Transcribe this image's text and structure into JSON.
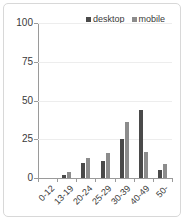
{
  "chart_data": {
    "type": "bar",
    "title": "",
    "subtitle": "",
    "xlabel": "",
    "ylabel": "",
    "categories": [
      "0-12",
      "13-19",
      "20-24",
      "25-29",
      "30-39",
      "40-49",
      "50-"
    ],
    "series": [
      {
        "name": "desktop",
        "color": "#4a4a4a",
        "values": [
          0,
          2,
          10,
          11,
          25,
          44,
          5
        ]
      },
      {
        "name": "mobile",
        "color": "#8c8c8c",
        "values": [
          0,
          4,
          13,
          16,
          36,
          17,
          9
        ]
      }
    ],
    "ylim": [
      0,
      100
    ],
    "yticks": [
      0,
      25,
      50,
      75,
      100
    ],
    "ytick_labels": [
      "0",
      "25",
      "50",
      "75",
      "100"
    ],
    "grid": true,
    "grid_axis": "y",
    "legend_position": "top-right",
    "xtick_label_rotation": -45
  },
  "legend": {
    "entries": [
      {
        "label": "desktop",
        "marker": "square-marker",
        "color": "#4a4a4a"
      },
      {
        "label": "mobile",
        "marker": "square-marker",
        "color": "#8c8c8c"
      }
    ]
  },
  "axes": {
    "y_tick_labels": [
      "100",
      "75",
      "50",
      "25",
      "0"
    ],
    "x_tick_labels": [
      "0-12",
      "13-19",
      "20-24",
      "25-29",
      "30-39",
      "40-49",
      "50-"
    ]
  },
  "colors": {
    "desktop": "#4a4a4a",
    "mobile": "#8c8c8c",
    "grid": "#ededed",
    "axis": "#9a9a9a",
    "border": "#d8d8d8",
    "text": "#3a3a3a",
    "background": "#ffffff"
  }
}
